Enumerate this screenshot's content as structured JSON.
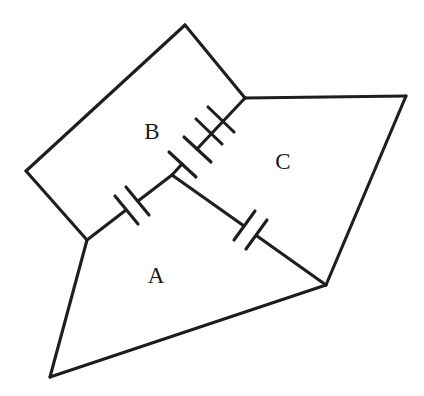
{
  "figure": {
    "background_color": "#ffffff",
    "stroke_color": "#1e1e20",
    "label_color": "#1a1a1a",
    "width": 424,
    "height": 396,
    "regions": [
      {
        "id": "A",
        "label": "A",
        "label_x": 156,
        "label_y": 278,
        "outline": "87,240 50,377 326,285 172,175"
      },
      {
        "id": "B",
        "label": "B",
        "label_x": 152,
        "label_y": 134,
        "outline": "185,25 26,171 87,240 172,175 245,98"
      },
      {
        "id": "C",
        "label": "C",
        "label_x": 283,
        "label_y": 164,
        "outline": "245,98 406,96 326,285 172,175"
      }
    ],
    "capacitors": [
      {
        "id": "cap-A-B",
        "between": "A-B",
        "lead_start_x": 87,
        "lead_start_y": 240,
        "lead_end_x": 172,
        "lead_end_y": 175,
        "plate_1_x": 126,
        "plate_1_y": 210,
        "plate_2_x": 137,
        "plate_2_y": 201
      },
      {
        "id": "cap-B-C",
        "between": "B-C",
        "lead_start_x": 172,
        "lead_start_y": 175,
        "lead_end_x": 245,
        "lead_end_y": 98,
        "plate_1_x": 181,
        "plate_1_y": 165,
        "plate_2_x": 194,
        "plate_2_y": 151
      },
      {
        "id": "cap-A-C",
        "between": "A-C",
        "lead_start_x": 172,
        "lead_start_y": 175,
        "lead_end_x": 326,
        "lead_end_y": 285,
        "plate_1_x": 243,
        "plate_1_y": 226,
        "plate_2_x": 256,
        "plate_2_y": 236
      }
    ],
    "junctions": [
      {
        "id": "center-node",
        "x": 172,
        "y": 175
      },
      {
        "id": "left-node",
        "x": 87,
        "y": 240
      },
      {
        "id": "top-right-node",
        "x": 245,
        "y": 98
      },
      {
        "id": "bottom-right-node",
        "x": 326,
        "y": 285
      }
    ]
  }
}
